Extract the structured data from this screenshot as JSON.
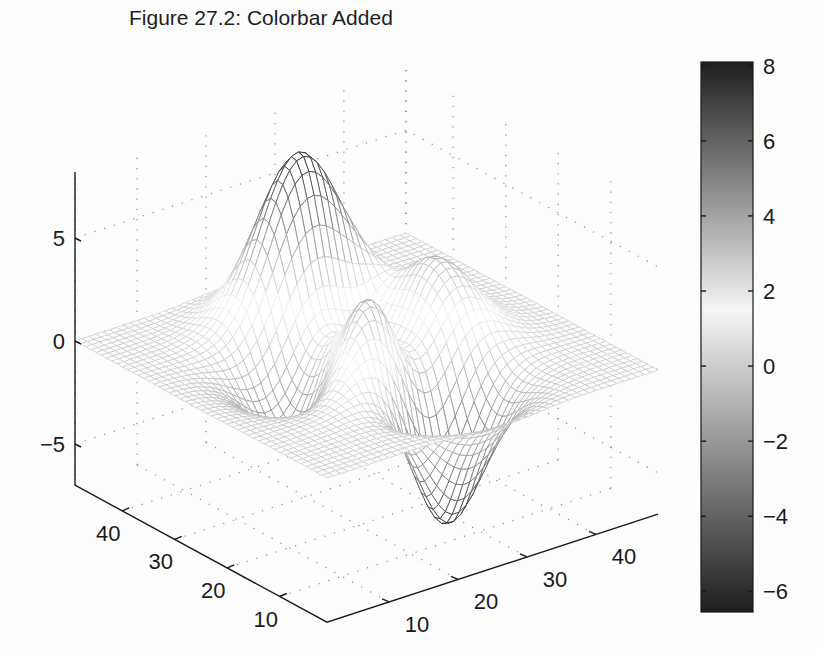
{
  "chart_data": {
    "type": "surface-3d",
    "title": "Figure 27.2: Colorbar Added",
    "function": "peaks(49)",
    "grid_size": 49,
    "xlabel": "",
    "ylabel": "",
    "zlabel": "",
    "x_ticks": [
      10,
      20,
      30,
      40
    ],
    "y_ticks": [
      10,
      20,
      30,
      40
    ],
    "z_ticks": [
      -5,
      0,
      5
    ],
    "x_tick_labels": [
      "10",
      "20",
      "30",
      "40"
    ],
    "y_tick_labels": [
      "10",
      "20",
      "30",
      "40"
    ],
    "z_tick_labels": [
      "−5",
      "0",
      "5"
    ],
    "xlim": [
      1,
      49
    ],
    "ylim": [
      1,
      49
    ],
    "zlim": [
      -8,
      8
    ],
    "grid": true,
    "colormap": "gray",
    "surface_extrema": {
      "max": {
        "value": 8.1,
        "label": "peak"
      },
      "min": {
        "value": -6.55,
        "label": "valley"
      }
    },
    "colorbar": {
      "position": "right",
      "range": [
        -6.55,
        8.1
      ],
      "ticks": [
        8,
        6,
        4,
        2,
        0,
        -2,
        -4,
        -6
      ],
      "tick_labels": [
        "8",
        "6",
        "4",
        "2",
        "0",
        "−2",
        "−4",
        "−6"
      ]
    }
  },
  "figure": {
    "title": "Figure 27.2: Colorbar Added"
  },
  "colors": {
    "axis": "#1a1a1a",
    "grid_dots": "#8a8a8a",
    "background": "#fdfdfd",
    "colormap_low": "#141414",
    "colormap_high": "#f2f2f2"
  }
}
